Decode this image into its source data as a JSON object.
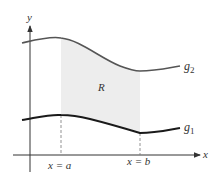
{
  "diagram": {
    "type": "region-between-curves",
    "axes": {
      "x_label": "x",
      "y_label": "y"
    },
    "curves": [
      {
        "name": "g2",
        "label_base": "g",
        "label_sub": "2",
        "role": "upper"
      },
      {
        "name": "g1",
        "label_base": "g",
        "label_sub": "1",
        "role": "lower"
      }
    ],
    "region_label": "R",
    "bounds": {
      "left": "x = a",
      "right": "x = b"
    },
    "colors": {
      "region_fill": "#ededed",
      "upper_curve": "#555555",
      "lower_curve": "#1a1a1a",
      "axis": "#333333"
    }
  }
}
